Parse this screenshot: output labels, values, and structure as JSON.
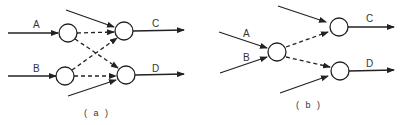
{
  "diagrams": [
    {
      "id": "a",
      "caption": "( a )",
      "inputs": [
        "A",
        "B"
      ],
      "outputs": [
        "C",
        "D"
      ],
      "description": "Two input nodes each cross-connected (dashed) to two output nodes; each output node also receives an extra external input"
    },
    {
      "id": "b",
      "caption": "( b )",
      "inputs": [
        "A",
        "B"
      ],
      "outputs": [
        "C",
        "D"
      ],
      "description": "Inputs A and B merge into a single node which fans out (dashed) to two output nodes; each output node also receives an extra external input"
    }
  ],
  "colors": {
    "line": "#222222",
    "node_fill": "#ffffff"
  }
}
